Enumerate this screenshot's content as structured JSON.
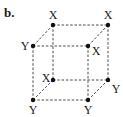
{
  "panel_label": "b.",
  "edge_style": "dashed",
  "colors": {
    "line": "#333333",
    "node": "#111111",
    "text": "#1a1a1a",
    "background": "#ffffff"
  },
  "vertices": [
    {
      "id": "back-top-left",
      "label": "X",
      "x": 53,
      "y": 25,
      "lx": 53,
      "ly": 15
    },
    {
      "id": "back-top-right",
      "label": "X",
      "x": 108,
      "y": 25,
      "lx": 108,
      "ly": 15
    },
    {
      "id": "front-top-left",
      "label": "Y",
      "x": 33,
      "y": 46,
      "lx": 25,
      "ly": 46
    },
    {
      "id": "front-top-right",
      "label": "X",
      "x": 88,
      "y": 46,
      "lx": 96,
      "ly": 51
    },
    {
      "id": "back-bottom-left",
      "label": "X",
      "x": 53,
      "y": 80,
      "lx": 46,
      "ly": 78
    },
    {
      "id": "back-bottom-right",
      "label": "Y",
      "x": 108,
      "y": 80,
      "lx": 116,
      "ly": 89
    },
    {
      "id": "front-bottom-left",
      "label": "Y",
      "x": 33,
      "y": 100,
      "lx": 33,
      "ly": 110
    },
    {
      "id": "front-bottom-right",
      "label": "Y",
      "x": 88,
      "y": 100,
      "lx": 88,
      "ly": 110
    }
  ],
  "edges": [
    [
      "back-top-left",
      "back-top-right"
    ],
    [
      "back-top-left",
      "front-top-left"
    ],
    [
      "back-top-right",
      "front-top-right"
    ],
    [
      "front-top-left",
      "front-top-right"
    ],
    [
      "back-top-left",
      "back-bottom-left"
    ],
    [
      "back-top-right",
      "back-bottom-right"
    ],
    [
      "front-top-left",
      "front-bottom-left"
    ],
    [
      "front-top-right",
      "front-bottom-right"
    ],
    [
      "back-bottom-left",
      "back-bottom-right"
    ],
    [
      "back-bottom-left",
      "front-bottom-left"
    ],
    [
      "back-bottom-right",
      "front-bottom-right"
    ],
    [
      "front-bottom-left",
      "front-bottom-right"
    ]
  ]
}
